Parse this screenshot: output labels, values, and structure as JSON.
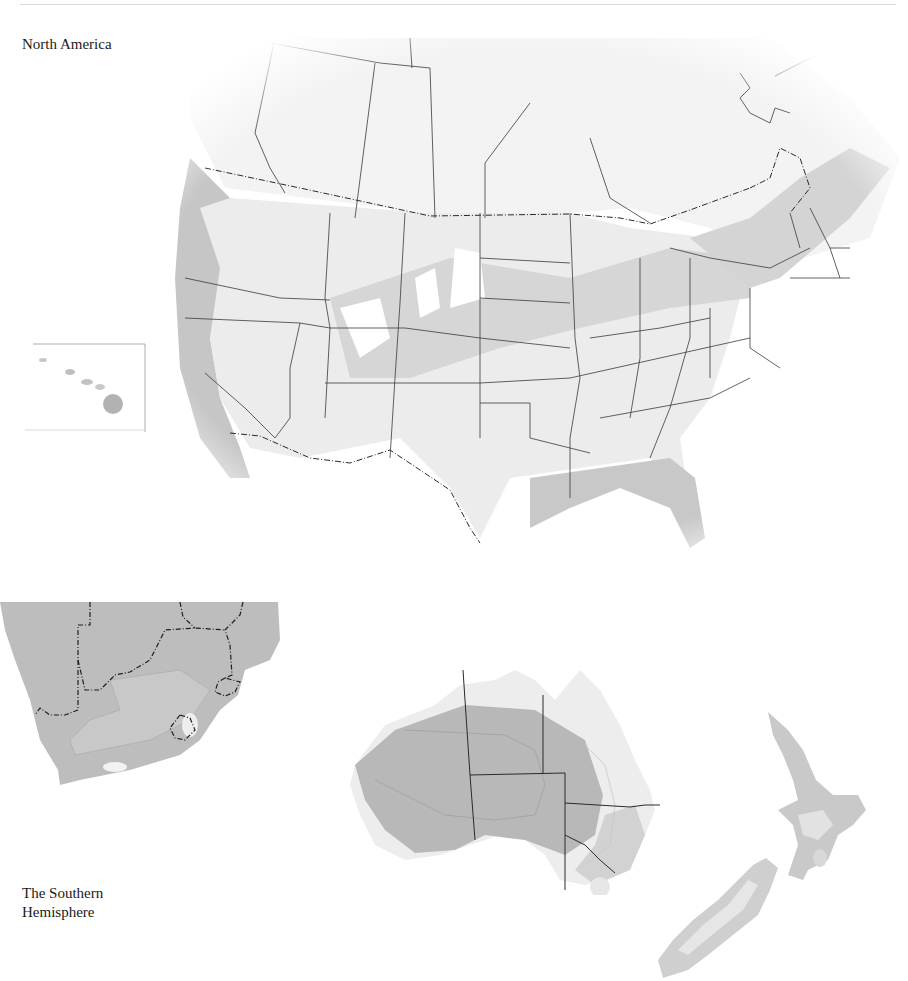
{
  "page": {
    "labels": {
      "north_america": "North America",
      "southern_hemisphere": "The Southern Hemisphere"
    }
  },
  "maps": [
    {
      "id": "north-america",
      "region": "North America",
      "inset": "Hawaii"
    },
    {
      "id": "southern-africa",
      "region": "Southern Africa"
    },
    {
      "id": "australia",
      "region": "Australia"
    },
    {
      "id": "new-zealand",
      "region": "New Zealand"
    }
  ],
  "colors": {
    "background": "#ffffff",
    "zone_light": "#ececec",
    "zone_mid": "#dadada",
    "zone_dark": "#c2c2c2",
    "zone_darkest": "#b6b6b6",
    "border": "#3a3a3a",
    "international_border": "#2a2a2a"
  }
}
